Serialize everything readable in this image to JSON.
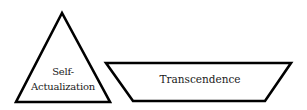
{
  "diagram": {
    "shapes": [
      {
        "type": "triangle",
        "label_lines": [
          "Self-",
          "Actualization"
        ]
      },
      {
        "type": "inverted-trapezoid",
        "label": "Transcendence"
      }
    ],
    "colors": {
      "stroke": "#000000",
      "fill": "#ffffff",
      "text": "#1a1a1a"
    }
  }
}
